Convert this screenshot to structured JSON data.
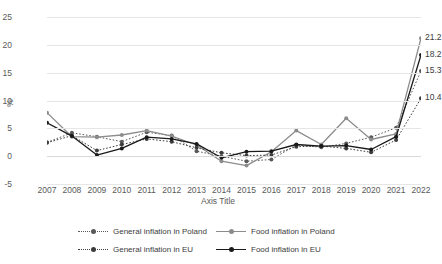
{
  "chart_data": {
    "type": "line",
    "title": "",
    "xlabel": "Axis Title",
    "ylabel": "%",
    "ylim": [
      -5,
      25
    ],
    "yticks": [
      -5,
      0,
      5,
      10,
      15,
      20,
      25
    ],
    "grid": true,
    "legend_position": "bottom",
    "categories": [
      "2007",
      "2008",
      "2009",
      "2010",
      "2011",
      "2012",
      "2013",
      "2014",
      "2015",
      "2016",
      "2017",
      "2018",
      "2019",
      "2020",
      "2021",
      "2022"
    ],
    "series": [
      {
        "name": "General inflation in Poland",
        "style": "dotted",
        "color": "#595959",
        "values": [
          2.5,
          4.2,
          3.5,
          2.6,
          4.3,
          3.7,
          0.9,
          0.0,
          -0.9,
          -0.6,
          2.0,
          1.6,
          2.3,
          3.4,
          5.1,
          15.3
        ]
      },
      {
        "name": "Food inflation in Poland",
        "style": "solid",
        "color": "#8c8c8c",
        "values": [
          7.8,
          3.5,
          3.4,
          3.8,
          4.6,
          3.6,
          2.0,
          -0.9,
          -1.7,
          0.8,
          4.6,
          2.1,
          6.8,
          3.0,
          4.0,
          21.2
        ]
      },
      {
        "name": "General inflation in EU",
        "style": "dotted",
        "color": "#3c3c3c",
        "values": [
          2.4,
          3.7,
          1.0,
          2.1,
          3.1,
          2.6,
          1.5,
          0.6,
          0.1,
          0.2,
          1.7,
          1.8,
          1.4,
          0.7,
          2.9,
          10.4
        ]
      },
      {
        "name": "Food inflation in EU",
        "style": "solid",
        "color": "#1a1a1a",
        "values": [
          6.0,
          3.6,
          0.2,
          1.4,
          3.4,
          3.1,
          2.2,
          -0.3,
          0.8,
          0.9,
          2.1,
          1.8,
          1.9,
          1.2,
          3.5,
          18.2
        ]
      }
    ],
    "data_labels": [
      {
        "text": "21.2",
        "series": "Food inflation in Poland",
        "category": "2022"
      },
      {
        "text": "18.2",
        "series": "Food inflation in EU",
        "category": "2022"
      },
      {
        "text": "15.3",
        "series": "General inflation in Poland",
        "category": "2022"
      },
      {
        "text": "10.4",
        "series": "General inflation in EU",
        "category": "2022"
      }
    ]
  },
  "axis": {
    "y_title": "%",
    "x_title": "Axis Title",
    "y_ticks": [
      "25",
      "20",
      "15",
      "10",
      "5",
      "0",
      "-5"
    ],
    "x_ticks": [
      "2007",
      "2008",
      "2009",
      "2010",
      "2011",
      "2012",
      "2013",
      "2014",
      "2015",
      "2016",
      "2017",
      "2018",
      "2019",
      "2020",
      "2021",
      "2022"
    ]
  },
  "labels": {
    "l0": "21.2",
    "l1": "18.2",
    "l2": "15.3",
    "l3": "10.4"
  },
  "legend": {
    "items": [
      {
        "label": "General inflation in Poland"
      },
      {
        "label": "Food inflation in Poland"
      },
      {
        "label": "General inflation in EU"
      },
      {
        "label": "Food inflation in EU"
      }
    ]
  },
  "colors": {
    "grid": "#e6e6e6",
    "text": "#5a5a5a",
    "poland_general": "#595959",
    "poland_food": "#8c8c8c",
    "eu_general": "#3c3c3c",
    "eu_food": "#1a1a1a"
  }
}
